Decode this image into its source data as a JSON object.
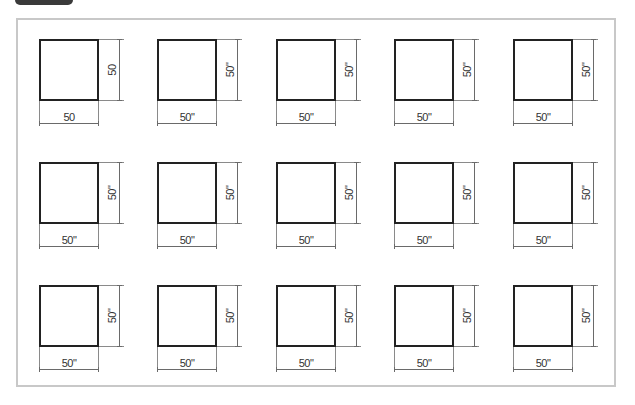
{
  "diagram": {
    "title": "",
    "grid": {
      "rows": 3,
      "columns": 5,
      "column_x": [
        39,
        157,
        276,
        394,
        513
      ],
      "row_y": [
        39,
        162,
        285
      ]
    },
    "colors": {
      "frame_border": "#c8c8c8",
      "square_border": "#222222",
      "dimension_line": "#6a6a6a",
      "label": "#333333",
      "tab": "#3a3a3a"
    },
    "squares": [
      {
        "row": 1,
        "col": 1,
        "width_label": "50",
        "height_label": "50"
      },
      {
        "row": 1,
        "col": 2,
        "width_label": "50\"",
        "height_label": "50\""
      },
      {
        "row": 1,
        "col": 3,
        "width_label": "50\"",
        "height_label": "50\""
      },
      {
        "row": 1,
        "col": 4,
        "width_label": "50\"",
        "height_label": "50\""
      },
      {
        "row": 1,
        "col": 5,
        "width_label": "50\"",
        "height_label": "50\""
      },
      {
        "row": 2,
        "col": 1,
        "width_label": "50\"",
        "height_label": "50\""
      },
      {
        "row": 2,
        "col": 2,
        "width_label": "50\"",
        "height_label": "50\""
      },
      {
        "row": 2,
        "col": 3,
        "width_label": "50\"",
        "height_label": "50\""
      },
      {
        "row": 2,
        "col": 4,
        "width_label": "50\"",
        "height_label": "50\""
      },
      {
        "row": 2,
        "col": 5,
        "width_label": "50\"",
        "height_label": "50\""
      },
      {
        "row": 3,
        "col": 1,
        "width_label": "50\"",
        "height_label": "50\""
      },
      {
        "row": 3,
        "col": 2,
        "width_label": "50\"",
        "height_label": "50\""
      },
      {
        "row": 3,
        "col": 3,
        "width_label": "50\"",
        "height_label": "50\""
      },
      {
        "row": 3,
        "col": 4,
        "width_label": "50\"",
        "height_label": "50\""
      },
      {
        "row": 3,
        "col": 5,
        "width_label": "50\"",
        "height_label": "50\""
      }
    ]
  }
}
